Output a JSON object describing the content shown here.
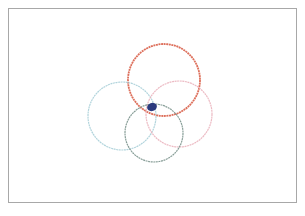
{
  "figure": {
    "frame": {
      "x": 8,
      "y": 8,
      "width": 289,
      "height": 195,
      "border_color": "#a8a8a8"
    },
    "circles": [
      {
        "name": "red-circle",
        "cx": 164,
        "cy": 80,
        "r": 36,
        "color": "#d9604a",
        "width": 1.8,
        "opacity": 0.9
      },
      {
        "name": "light-blue-circle",
        "cx": 122,
        "cy": 116,
        "r": 34,
        "color": "#a9cfd8",
        "width": 1.2,
        "opacity": 0.9
      },
      {
        "name": "pink-circle",
        "cx": 179,
        "cy": 114,
        "r": 33,
        "color": "#eab2bd",
        "width": 1.2,
        "opacity": 0.9
      },
      {
        "name": "gray-green-circle",
        "cx": 154,
        "cy": 133,
        "r": 29,
        "color": "#7b938d",
        "width": 1.2,
        "opacity": 0.9
      }
    ],
    "blob": {
      "cx": 152,
      "cy": 107,
      "rx": 5,
      "ry": 4,
      "color": "#2b3a7e"
    }
  }
}
